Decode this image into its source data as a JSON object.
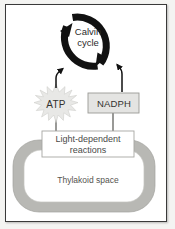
{
  "figure": {
    "background_color": "#f4f4f2",
    "frame_color": "#3a3a3a",
    "panel_color": "#ffffff"
  },
  "nodes": {
    "calvin_cycle": {
      "label": "Calvin\ncycle",
      "line1": "Calvin",
      "line2": "cycle",
      "shape": "circular-arrow-ring",
      "color": "#111111"
    },
    "atp": {
      "label": "ATP",
      "shape": "starburst",
      "fill": "#e8e8e6",
      "text_color": "#33322f"
    },
    "nadph": {
      "label": "NADPH",
      "shape": "rectangle",
      "fill": "#e4e4e2",
      "border": "#9a9a96",
      "text_color": "#33322f"
    },
    "light_dependent_reactions": {
      "label": "Light-dependent reactions",
      "line1": "Light-dependent",
      "line2": "reactions",
      "shape": "rectangle",
      "fill": "#ffffff",
      "border": "#a6a6a2",
      "text_color": "#4a4a48"
    },
    "thylakoid": {
      "label": "Thylakoid space",
      "shape": "rounded-ring",
      "membrane_fill": "#b8b8b4",
      "lumen_fill": "#ffffff",
      "text_color": "#55544f"
    }
  },
  "connections": [
    {
      "from": "atp",
      "to": "calvin_cycle",
      "type": "arrow",
      "direction": "up"
    },
    {
      "from": "nadph",
      "to": "calvin_cycle",
      "type": "arrow",
      "direction": "up"
    },
    {
      "from": "light_dependent_reactions",
      "to": "atp",
      "type": "line",
      "direction": "up"
    },
    {
      "from": "light_dependent_reactions",
      "to": "nadph",
      "type": "line",
      "direction": "up"
    }
  ],
  "cycle_arrows": {
    "count": 2,
    "rotation": "clockwise",
    "stroke_color": "#111111"
  }
}
